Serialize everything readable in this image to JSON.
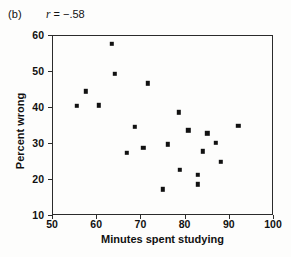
{
  "figure": {
    "panel_label": "(b)",
    "correlation_symbol": "r",
    "correlation_text": "= −.58",
    "correlation_full": "r = −.58"
  },
  "chart_data": {
    "type": "scatter",
    "title": "",
    "xlabel": "Minutes spent studying",
    "ylabel": "Percent wrong",
    "xlim": [
      50,
      100
    ],
    "ylim": [
      10,
      60
    ],
    "xticks": [
      50,
      60,
      70,
      80,
      90,
      100
    ],
    "yticks": [
      10,
      20,
      30,
      40,
      50,
      60
    ],
    "grid": false,
    "legend": null,
    "annotations": [
      {
        "text": "(b)",
        "role": "panel-label"
      },
      {
        "text": "r = −.58",
        "role": "correlation-coefficient"
      }
    ],
    "correlation": -0.58,
    "marker": {
      "shape": "square",
      "color": "#111111",
      "size": 4.4
    },
    "points": [
      {
        "x": 63.3,
        "y": 57.9
      },
      {
        "x": 64.0,
        "y": 49.5
      },
      {
        "x": 71.4,
        "y": 46.9
      },
      {
        "x": 57.4,
        "y": 44.6
      },
      {
        "x": 55.4,
        "y": 40.6
      },
      {
        "x": 60.4,
        "y": 40.8
      },
      {
        "x": 78.5,
        "y": 38.8
      },
      {
        "x": 68.5,
        "y": 34.8
      },
      {
        "x": 80.6,
        "y": 33.8
      },
      {
        "x": 91.9,
        "y": 35.1
      },
      {
        "x": 84.9,
        "y": 33.0
      },
      {
        "x": 76.0,
        "y": 29.9
      },
      {
        "x": 86.9,
        "y": 30.4
      },
      {
        "x": 70.4,
        "y": 29.0
      },
      {
        "x": 66.7,
        "y": 27.6
      },
      {
        "x": 83.9,
        "y": 28.0
      },
      {
        "x": 88.0,
        "y": 25.0
      },
      {
        "x": 78.7,
        "y": 22.8
      },
      {
        "x": 82.7,
        "y": 21.5
      },
      {
        "x": 82.7,
        "y": 18.8
      },
      {
        "x": 74.9,
        "y": 17.4
      }
    ]
  }
}
